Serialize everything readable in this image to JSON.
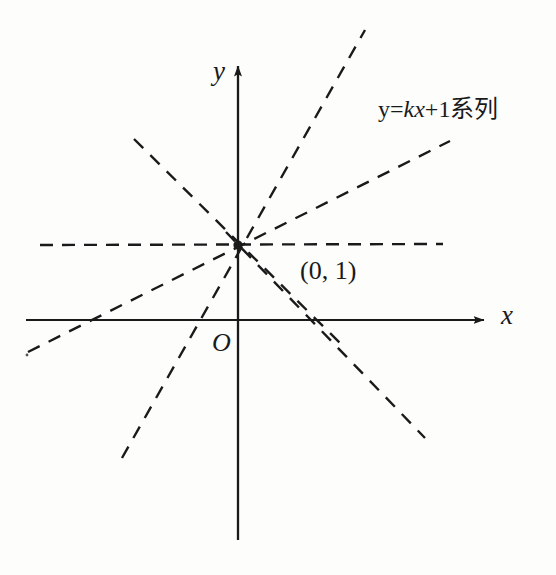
{
  "figure": {
    "background_color": "#fdfdfc",
    "ink_color": "#1a1a1a",
    "width": 556,
    "height": 575
  },
  "labels": {
    "y_axis": "y",
    "x_axis": "x",
    "origin": "O",
    "point": "(0, 1)",
    "series_prefix": "y=",
    "series_k": "k",
    "series_x": "x",
    "series_suffix": "+1系列",
    "series_full": "y=kx+1系列"
  },
  "chart_data": {
    "type": "line",
    "title": "",
    "subtitle": "",
    "xlabel": "x",
    "ylabel": "y",
    "legend": [
      "y=kx+1系列"
    ],
    "legend_position": "upper-right",
    "grid": false,
    "axes": {
      "origin_px": [
        238,
        320
      ],
      "x_axis_px": {
        "x1": 26,
        "y1": 320,
        "x2": 488,
        "y2": 320,
        "arrow": "right"
      },
      "y_axis_px": {
        "x1": 238,
        "y1": 62,
        "x2": 238,
        "y2": 540,
        "arrow": "up"
      },
      "unit_px": 75
    },
    "annotations": [
      {
        "text": "(0, 1)",
        "px": [
          300,
          258
        ],
        "describes": "common point of the pencil of lines"
      },
      {
        "text": "O",
        "px": [
          212,
          330
        ],
        "describes": "origin"
      },
      {
        "text": "y=kx+1系列",
        "px": [
          378,
          97
        ],
        "describes": "family of lines label"
      }
    ],
    "common_point": {
      "x": 0,
      "y": 1,
      "px": [
        238,
        245
      ],
      "marker": "dot"
    },
    "series": [
      {
        "name": "k = 0",
        "k": 0,
        "b": 1,
        "dash": true,
        "px_from": [
          40,
          245
        ],
        "px_to": [
          443,
          244
        ]
      },
      {
        "name": "k ≈ 0.5",
        "k": 0.49,
        "b": 1,
        "dash": true,
        "px_from": [
          28,
          352
        ],
        "px_to": [
          450,
          141
        ]
      },
      {
        "name": "k ≈ 1.7",
        "k": 1.72,
        "b": 1,
        "dash": true,
        "px_from": [
          122,
          458
        ],
        "px_to": [
          365,
          30
        ]
      },
      {
        "name": "k ≈ -1.0",
        "k": -1.0,
        "b": 1,
        "dash": true,
        "px_from": [
          134,
          139
        ],
        "px_to": [
          342,
          345
        ]
      },
      {
        "name": "k ≈ -1.12",
        "k": -1.12,
        "b": 1,
        "dash": true,
        "px_from": [
          226,
          232
        ],
        "px_to": [
          425,
          438
        ]
      }
    ]
  }
}
